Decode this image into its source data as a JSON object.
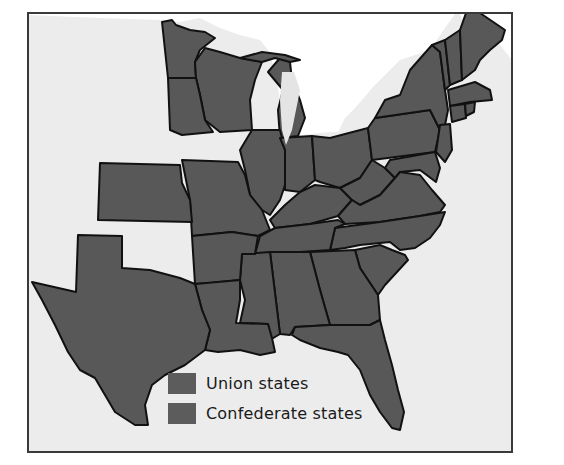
{
  "map": {
    "colors": {
      "frame": "#3a3a3a",
      "water": "#ececec",
      "foreign_land": "#ffffff",
      "territory": "#ececec",
      "state_fill": "#585858",
      "border": "#111111",
      "lakes": "#e4e4e4"
    }
  },
  "legend": {
    "items": [
      {
        "label": "Union states",
        "color": "#5c5c5c"
      },
      {
        "label": "Confederate states",
        "color": "#5c5c5c"
      }
    ]
  }
}
